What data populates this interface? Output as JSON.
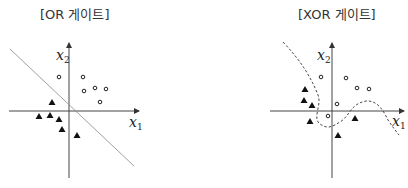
{
  "panels": [
    {
      "title": "[OR 게이트]",
      "x_axis_label": "x",
      "x_axis_sub": "1",
      "y_axis_label": "x",
      "y_axis_sub": "2",
      "boundary": "straight line (linear separator)"
    },
    {
      "title": "[XOR 게이트]",
      "x_axis_label": "x",
      "x_axis_sub": "1",
      "y_axis_label": "x",
      "y_axis_sub": "2",
      "boundary": "dashed curve (non-linear separator)"
    }
  ],
  "legend": {
    "circle": "class 1 (output 1)",
    "triangle": "class 0 (output 0)"
  }
}
